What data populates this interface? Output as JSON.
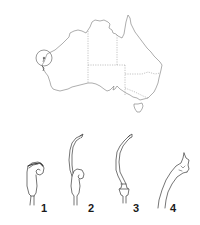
{
  "figure": {
    "map": {
      "region": "Australia",
      "borders_style": "dashed",
      "marker": {
        "type": "circle",
        "location": "Western Australia, west coast"
      }
    },
    "specimens": [
      {
        "label": "1",
        "description": "coiled style, short"
      },
      {
        "label": "2",
        "description": "elongated style with coiled base"
      },
      {
        "label": "3",
        "description": "elongated curved style"
      },
      {
        "label": "4",
        "description": "enlarged tip detail"
      }
    ],
    "colors": {
      "line": "#6a6a6a",
      "ink": "#2a2a2a",
      "background": "#ffffff"
    }
  }
}
